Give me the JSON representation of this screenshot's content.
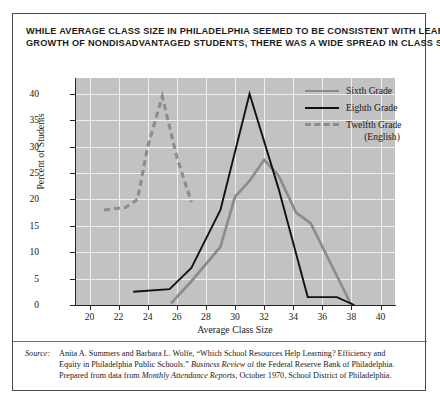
{
  "title": {
    "line1": "WHILE AVERAGE CLASS SIZE IN PHILADELPHIA SEEMED TO BE CONSISTENT WITH LEARNING",
    "line2": "GROWTH OF NONDISADVANTAGED STUDENTS, THERE WAS A WIDE SPREAD IN CLASS SIZES."
  },
  "legend": {
    "items": [
      {
        "label": "Sixth Grade",
        "style": "solid",
        "color": "#8c8c8c"
      },
      {
        "label": "Eighth Grade",
        "style": "solid",
        "color": "#111111"
      },
      {
        "label": "Twelfth Grade",
        "style": "dashed",
        "color": "#8c8c8c"
      }
    ],
    "sublabel": "(English)"
  },
  "axes": {
    "y_ticks": [
      "0",
      "5",
      "10",
      "15",
      "20",
      "25",
      "30",
      "35",
      "40"
    ],
    "x_ticks": [
      "20",
      "22",
      "24",
      "26",
      "28",
      "30",
      "32",
      "34",
      "36",
      "38",
      "40"
    ],
    "y_title": "Percent of Students",
    "x_title": "Average Class Size"
  },
  "source": {
    "label": "Source:",
    "line1_a": "Anita A. Summers and Barbara L. Wolfe, “Which School Resources Help Learning?  Efficiency and",
    "line2_a": "Equity in Philadelphia Public Schools.”  ",
    "line2_it": "Business Review",
    "line2_b": " of the Federal Reserve Bank of Philadelphia.",
    "line3_a": "Prepared from data from ",
    "line3_it": "Monthly Attendance Reports",
    "line3_b": ", October 1970, School District of Philadelphia."
  },
  "chart_data": {
    "type": "line",
    "title": "WHILE AVERAGE CLASS SIZE IN PHILADELPHIA SEEMED TO BE CONSISTENT WITH LEARNING GROWTH OF NONDISADVANTAGED STUDENTS, THERE WAS A WIDE SPREAD IN CLASS SIZES.",
    "xlabel": "Average Class Size",
    "ylabel": "Percent of Students",
    "xlim": [
      19,
      41
    ],
    "ylim": [
      0,
      43
    ],
    "xticks": [
      20,
      22,
      24,
      26,
      28,
      30,
      32,
      34,
      36,
      38,
      40
    ],
    "yticks": [
      0,
      5,
      10,
      15,
      20,
      25,
      30,
      35,
      40
    ],
    "grid": true,
    "legend_position": "upper right",
    "series": [
      {
        "name": "Sixth Grade",
        "color": "#8c8c8c",
        "style": "solid",
        "x": [
          25.6,
          27.0,
          29.0,
          30.0,
          31.0,
          32.0,
          33.0,
          34.2,
          35.2,
          38.0
        ],
        "y": [
          0.3,
          4.5,
          11.0,
          20.5,
          23.5,
          27.5,
          24.5,
          17.5,
          15.5,
          0.0
        ]
      },
      {
        "name": "Eighth Grade",
        "color": "#111111",
        "style": "solid",
        "x": [
          23.0,
          25.5,
          27.0,
          29.0,
          31.0,
          33.0,
          35.0,
          37.0,
          38.2
        ],
        "y": [
          2.5,
          3.0,
          7.0,
          18.0,
          40.0,
          22.0,
          1.5,
          1.5,
          0.0
        ]
      },
      {
        "name": "Twelfth Grade (English)",
        "color": "#8c8c8c",
        "style": "dashed",
        "x": [
          21.0,
          22.5,
          23.3,
          24.0,
          25.0,
          26.0,
          27.0
        ],
        "y": [
          18.0,
          18.5,
          20.0,
          30.0,
          39.5,
          28.0,
          19.5
        ]
      }
    ]
  }
}
